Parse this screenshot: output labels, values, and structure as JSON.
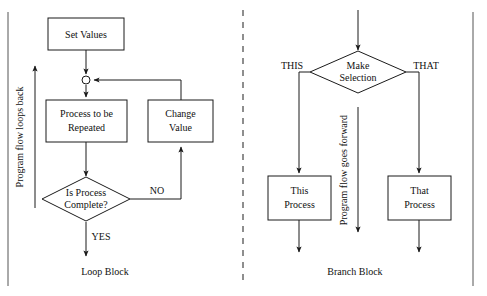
{
  "figure": {
    "type": "flowchart",
    "panels": [
      {
        "id": "loop-block",
        "caption": "Loop Block",
        "annotation": "Program flow loops back",
        "nodes": [
          {
            "id": "set-values",
            "shape": "rectangle",
            "lines": [
              "Set Values"
            ]
          },
          {
            "id": "junction",
            "shape": "circle",
            "lines": []
          },
          {
            "id": "process-repeated",
            "shape": "rectangle",
            "lines": [
              "Process to be",
              "Repeated"
            ]
          },
          {
            "id": "change-value",
            "shape": "rectangle",
            "lines": [
              "Change",
              "Value"
            ]
          },
          {
            "id": "is-process-complete",
            "shape": "diamond",
            "lines": [
              "Is Process",
              "Complete?"
            ]
          }
        ],
        "edge_labels": [
          {
            "id": "no",
            "text": "NO"
          },
          {
            "id": "yes",
            "text": "YES"
          }
        ]
      },
      {
        "id": "branch-block",
        "caption": "Branch Block",
        "annotation": "Program flow goes forward",
        "nodes": [
          {
            "id": "make-selection",
            "shape": "diamond",
            "lines": [
              "Make",
              "Selection"
            ]
          },
          {
            "id": "this-process",
            "shape": "rectangle",
            "lines": [
              "This",
              "Process"
            ]
          },
          {
            "id": "that-process",
            "shape": "rectangle",
            "lines": [
              "That",
              "Process"
            ]
          }
        ],
        "edge_labels": [
          {
            "id": "this",
            "text": "THIS"
          },
          {
            "id": "that",
            "text": "THAT"
          }
        ]
      }
    ],
    "colors": {
      "background": "#ffffff",
      "stroke": "#1a1a1a",
      "text": "#111111",
      "divider": "#444444"
    }
  }
}
